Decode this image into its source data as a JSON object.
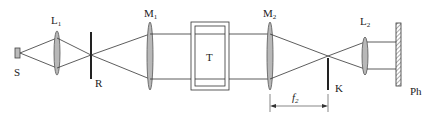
{
  "diagram": {
    "type": "optical-schlieren-setup",
    "labels": {
      "source": "S",
      "lens1": "L",
      "lens1_sub": "1",
      "slit": "R",
      "mirror1": "M",
      "mirror1_sub": "1",
      "test_section": "T",
      "mirror2": "M",
      "mirror2_sub": "2",
      "knife_edge": "K",
      "lens2": "L",
      "lens2_sub": "2",
      "screen": "Ph",
      "focal_length": "f",
      "focal_length_sub": "2"
    },
    "colors": {
      "line": "#333333",
      "lens_fill": "#b8b8b8",
      "background": "#ffffff"
    }
  }
}
